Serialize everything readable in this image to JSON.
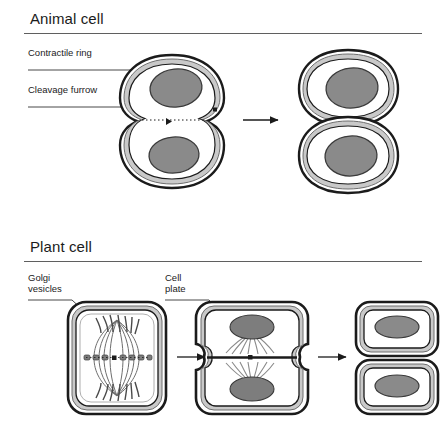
{
  "figure": {
    "background_color": "#ffffff",
    "line_color": "#1b1b1b",
    "rule_color": "#5f5f5f",
    "nucleus_fill": "#8a8a8a",
    "membrane_fill": "#c9c9c9",
    "cytoplasm_fill": "#ffffff"
  },
  "sections": {
    "animal": {
      "title": "Animal cell",
      "labels": {
        "contractile_ring": "Contractile ring",
        "cleavage_furrow": "Cleavage furrow"
      },
      "stages": [
        {
          "name": "dividing-animal-cell",
          "description": "Cell constricted into figure-eight by contractile ring, two nuclei"
        },
        {
          "name": "separated-animal-daughter-cells",
          "description": "Two rounded daughter cells, each with one nucleus"
        }
      ]
    },
    "plant": {
      "title": "Plant cell",
      "labels": {
        "golgi_vesicles": "Golgi\nvesicles",
        "cell_plate": "Cell\nplate"
      },
      "stages": [
        {
          "name": "plant-cell-golgi-vesicles",
          "description": "Rectangular plant cell with spindle fibers and Golgi vesicles aligned at equator"
        },
        {
          "name": "plant-cell-forming-cell-plate",
          "description": "Cell plate forming across the middle between two nuclei with radiating fibers"
        },
        {
          "name": "separated-plant-daughter-cells",
          "description": "Two separate rounded-rectangular daughter cells with walls and nuclei"
        }
      ]
    }
  },
  "arrows": [
    {
      "name": "animal-progression-arrow"
    },
    {
      "name": "plant-progression-arrow-1"
    },
    {
      "name": "plant-progression-arrow-2"
    }
  ]
}
